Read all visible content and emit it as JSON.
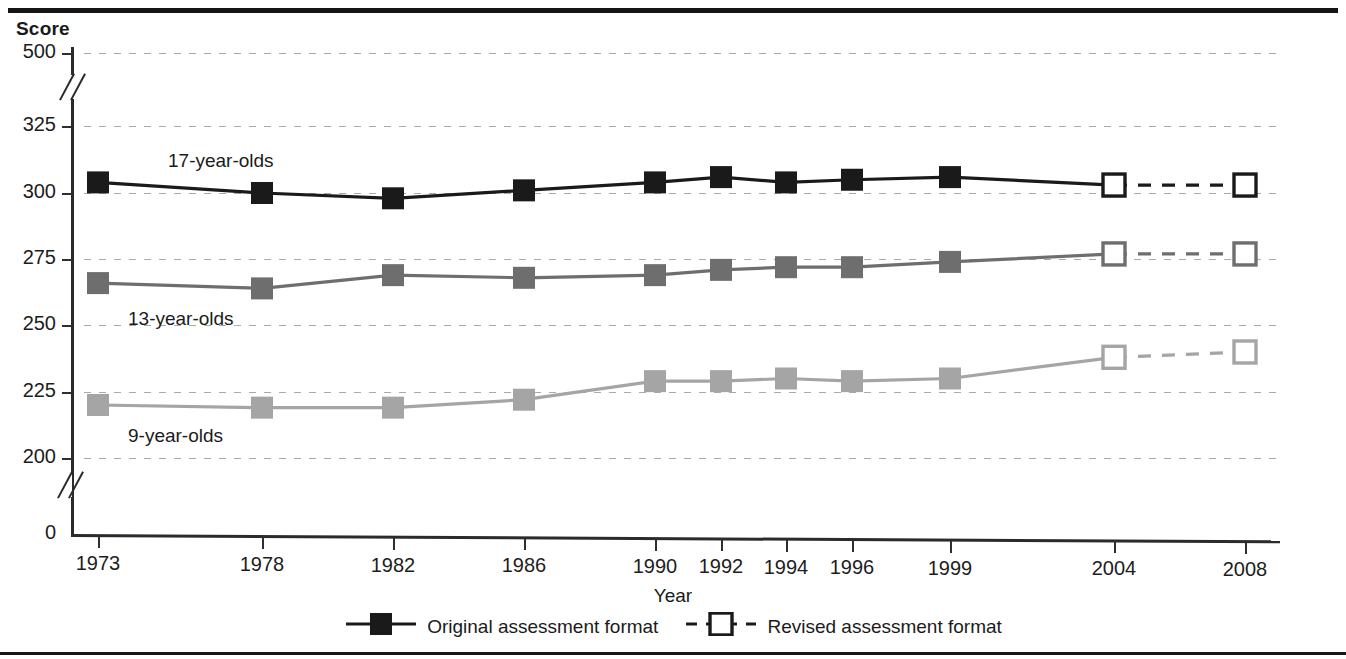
{
  "header": {
    "y_axis_title": "Score",
    "x_axis_title": "Year"
  },
  "legend": {
    "items": [
      {
        "label": "Original assessment format",
        "key": "filled-square-solid-line",
        "marker": "filled",
        "line": "solid"
      },
      {
        "label": "Revised assessment format",
        "key": "open-square-dashed-line",
        "marker": "open",
        "line": "dashed"
      }
    ]
  },
  "annotations": [
    {
      "text": "17-year-olds",
      "x": 168,
      "y": 150
    },
    {
      "text": "13-year-olds",
      "x": 128,
      "y": 308
    },
    {
      "text": "9-year-olds",
      "x": 128,
      "y": 425
    }
  ],
  "chart_data": {
    "type": "line",
    "title": "",
    "xlabel": "Year",
    "ylabel": "Score",
    "x": [
      1973,
      1978,
      1982,
      1986,
      1990,
      1992,
      1994,
      1996,
      1999,
      2004,
      2008
    ],
    "xtick_labels": [
      "1973",
      "1978",
      "1982",
      "1986",
      "1990",
      "1992",
      "1994",
      "1996",
      "1999",
      "2004",
      "2008"
    ],
    "ytick_labels": [
      "0",
      "200",
      "225",
      "250",
      "275",
      "300",
      "325",
      "500"
    ],
    "ytick_values": [
      0,
      200,
      225,
      250,
      275,
      300,
      325,
      500
    ],
    "ylim": [
      200,
      325
    ],
    "axis_breaks": [
      "0-200",
      "325-500"
    ],
    "grid": true,
    "grid_style": "dotted-horizontal",
    "legend_position": "bottom-center",
    "series": [
      {
        "name": "17-year-olds",
        "color": "#1a1a1a",
        "original_format": {
          "x": [
            1973,
            1978,
            1982,
            1986,
            1990,
            1992,
            1994,
            1996,
            1999,
            2004
          ],
          "values": [
            304,
            300,
            298,
            301,
            304,
            306,
            304,
            305,
            306,
            303
          ]
        },
        "revised_format": {
          "x": [
            2004,
            2008
          ],
          "values": [
            303,
            303
          ]
        }
      },
      {
        "name": "13-year-olds",
        "color": "#6e6e6e",
        "original_format": {
          "x": [
            1973,
            1978,
            1982,
            1986,
            1990,
            1992,
            1994,
            1996,
            1999,
            2004
          ],
          "values": [
            266,
            264,
            269,
            268,
            269,
            271,
            272,
            272,
            274,
            277
          ]
        },
        "revised_format": {
          "x": [
            2004,
            2008
          ],
          "values": [
            277,
            277
          ]
        }
      },
      {
        "name": "9-year-olds",
        "color": "#a5a5a5",
        "original_format": {
          "x": [
            1973,
            1978,
            1982,
            1986,
            1990,
            1992,
            1994,
            1996,
            1999,
            2004
          ],
          "values": [
            220,
            219,
            219,
            222,
            229,
            229,
            230,
            229,
            230,
            238
          ]
        },
        "revised_format": {
          "x": [
            2004,
            2008
          ],
          "values": [
            238,
            240
          ]
        }
      }
    ]
  }
}
